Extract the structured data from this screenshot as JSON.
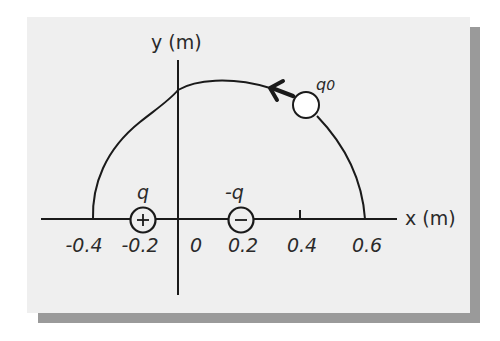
{
  "diagram": {
    "axes": {
      "x_label": "x (m)",
      "y_label": "y (m)",
      "x_ticks": [
        "-0.4",
        "-0.2",
        "0",
        "0.2",
        "0.4",
        "0.6"
      ]
    },
    "charges": [
      {
        "label": "q",
        "symbol": "+",
        "x": -0.2,
        "y": 0
      },
      {
        "label": "-q",
        "symbol": "−",
        "x": 0.2,
        "y": 0
      }
    ],
    "test_charge": {
      "label": "q0",
      "label_main": "q",
      "label_sub": "0"
    },
    "path": {
      "start": "-0.4",
      "end": "0.6",
      "direction": "counterclockwise (arrow pointing left along top of arc)"
    },
    "colors": {
      "card_bg": "#efefef",
      "shadow": "#9a9a9a",
      "ink": "#1a1a1a"
    }
  }
}
